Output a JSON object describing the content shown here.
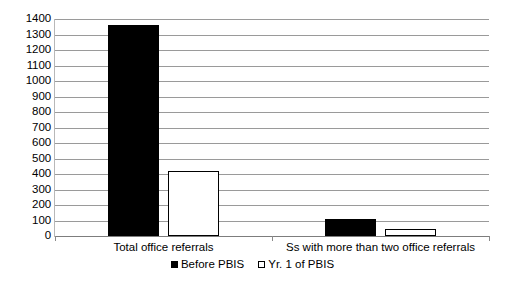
{
  "chart_data": {
    "type": "bar",
    "title": "",
    "subtitle": "",
    "xlabel": "",
    "ylabel": "",
    "ylim": [
      0,
      1400
    ],
    "ytick_step": 100,
    "yticks": [
      1400,
      1300,
      1200,
      1100,
      1000,
      900,
      800,
      700,
      600,
      500,
      400,
      300,
      200,
      100,
      0
    ],
    "ytick_labels": [
      "1400",
      "1300",
      "1200",
      "1100",
      "1000",
      "900",
      "800",
      "700",
      "600",
      "500",
      "400",
      "300",
      "200",
      "100",
      "0"
    ],
    "categories": [
      "Total office referrals",
      "Ss with more than two office referrals"
    ],
    "series": [
      {
        "name": "Before PBIS",
        "values": [
          1360,
          110
        ],
        "color": "#000000",
        "marker": "filled-square"
      },
      {
        "name": "Yr. 1 of PBIS",
        "values": [
          420,
          45
        ],
        "color": "#ffffff",
        "marker": "hollow-square"
      }
    ],
    "grid": true,
    "grid_axis": "y",
    "grid_color": "#9a9a9a",
    "legend": true,
    "legend_position": "bottom-center",
    "background_color": "#ffffff",
    "axis_color": "#7d7d7d"
  },
  "legend": {
    "entries": [
      {
        "label": "Before PBIS"
      },
      {
        "label": "Yr. 1 of PBIS"
      }
    ]
  },
  "axes": {
    "x_categories": [
      {
        "label": "Total office referrals"
      },
      {
        "label": "Ss with more than two office referrals"
      }
    ]
  }
}
